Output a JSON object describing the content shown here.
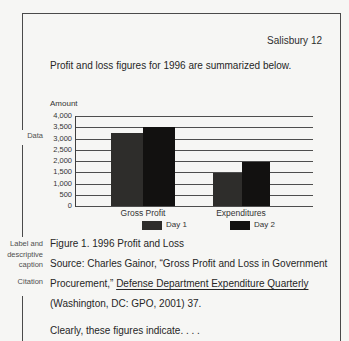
{
  "page": {
    "running_head": "Salisbury 12",
    "intro_text": "Profit and loss figures for 1996 are summarized below.",
    "closing_text": "Clearly, these figures indicate. . . ."
  },
  "margin_annotations": {
    "data_label": "Data",
    "caption_label": "Label and\ndescriptive\ncaption",
    "citation_label": "Citation"
  },
  "figure_block": {
    "caption": "Figure 1. 1996 Profit and Loss",
    "source_line_1": "Source: Charles Gainor, “Gross Profit and Loss in Government",
    "source_line_2_plain": "Procurement,” ",
    "source_line_2_underlined": "Defense Department Expenditure Quarterly",
    "source_line_3": "(Washington, DC: GPO, 2001) 37."
  },
  "chart_data": {
    "type": "bar",
    "title": "",
    "axis_label": "Amount",
    "categories": [
      "Gross Profit",
      "Expenditures"
    ],
    "series": [
      {
        "name": "Day 1",
        "values": [
          3250,
          1450
        ],
        "color": "#2e2d2b"
      },
      {
        "name": "Day 2",
        "values": [
          3500,
          1950
        ],
        "color": "#121110"
      }
    ],
    "ylim": [
      0,
      4000
    ],
    "ytick_step": 500,
    "yticks": [
      "4,000",
      "3,500",
      "3,000",
      "2,500",
      "2,000",
      "1,500",
      "1,000",
      "500",
      "0"
    ],
    "grid": true,
    "legend_position": "below-categories"
  }
}
